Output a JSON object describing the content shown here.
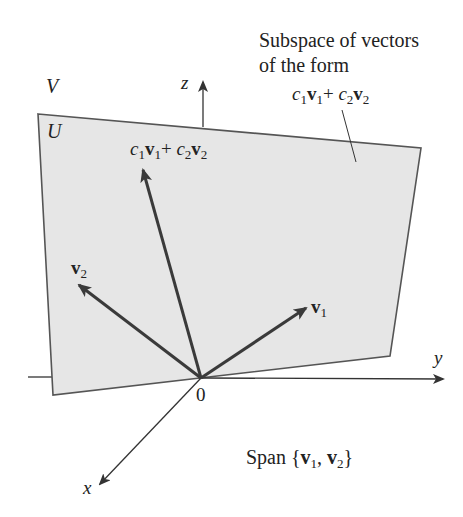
{
  "labels": {
    "space_V": "V",
    "subspace_U": "U",
    "z_axis": "z",
    "y_axis": "y",
    "x_axis": "x",
    "origin": "0",
    "caption_line1": "Subspace of vectors",
    "caption_line2": "of the form",
    "combo_c1": "c",
    "combo_sub1": "1",
    "combo_v1": "v",
    "combo_sub1b": "1",
    "combo_plus": "+ ",
    "combo_c2": "c",
    "combo_sub2": "2",
    "combo_v2": "v",
    "combo_sub2b": "2",
    "v1_base": "v",
    "v1_sub": "1",
    "v2_base": "v",
    "v2_sub": "2",
    "span_prefix": "Span {",
    "span_v1": "v",
    "span_sub1": "1",
    "span_comma": ", ",
    "span_v2": "v",
    "span_sub2": "2",
    "span_suffix": "}"
  },
  "colors": {
    "plane_fill": "#e6e6e6",
    "plane_edge": "#555555",
    "vector": "#3a3a3a",
    "axis": "#333333"
  }
}
